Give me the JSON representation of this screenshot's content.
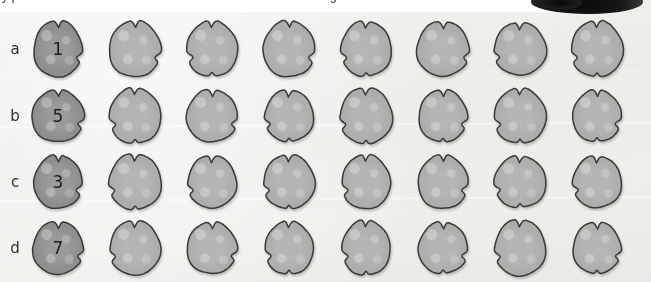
{
  "figure": {
    "title_fragment_left": "y p",
    "title_fragment_right": "g",
    "background_color": "#f1f0ed",
    "corner_object": "dark-blob",
    "grid": {
      "rows": 4,
      "columns": 8,
      "row_labels": [
        "a",
        "b",
        "c",
        "d"
      ],
      "column_x_centers": [
        58,
        135,
        212,
        289,
        366,
        443,
        520,
        597
      ],
      "row_y_centers": [
        49,
        116,
        182,
        248
      ]
    },
    "colors": {
      "specimen_fill_light": "#adadab",
      "specimen_fill_dark": "#8e8e8c",
      "specimen_outline": "#3a3a38",
      "label_text": "#2f2f2f",
      "number_text": "#1e1e1e",
      "strip_background": "#ffffff"
    },
    "rows": [
      {
        "label": "a",
        "cells": [
          {
            "number": "1",
            "shade": "dark"
          },
          {
            "number": "",
            "shade": "light"
          },
          {
            "number": "",
            "shade": "light"
          },
          {
            "number": "",
            "shade": "light"
          },
          {
            "number": "",
            "shade": "light"
          },
          {
            "number": "",
            "shade": "light"
          },
          {
            "number": "",
            "shade": "light"
          },
          {
            "number": "",
            "shade": "light"
          }
        ]
      },
      {
        "label": "b",
        "cells": [
          {
            "number": "5",
            "shade": "dark"
          },
          {
            "number": "",
            "shade": "light"
          },
          {
            "number": "",
            "shade": "light"
          },
          {
            "number": "",
            "shade": "light"
          },
          {
            "number": "",
            "shade": "light"
          },
          {
            "number": "",
            "shade": "light"
          },
          {
            "number": "",
            "shade": "light"
          },
          {
            "number": "",
            "shade": "light"
          }
        ]
      },
      {
        "label": "c",
        "cells": [
          {
            "number": "3",
            "shade": "dark"
          },
          {
            "number": "",
            "shade": "light"
          },
          {
            "number": "",
            "shade": "light"
          },
          {
            "number": "",
            "shade": "light"
          },
          {
            "number": "",
            "shade": "light"
          },
          {
            "number": "",
            "shade": "light"
          },
          {
            "number": "",
            "shade": "light"
          },
          {
            "number": "",
            "shade": "light"
          }
        ]
      },
      {
        "label": "d",
        "cells": [
          {
            "number": "7",
            "shade": "dark"
          },
          {
            "number": "",
            "shade": "light"
          },
          {
            "number": "",
            "shade": "light"
          },
          {
            "number": "",
            "shade": "light"
          },
          {
            "number": "",
            "shade": "light"
          },
          {
            "number": "",
            "shade": "light"
          },
          {
            "number": "",
            "shade": "light"
          },
          {
            "number": "",
            "shade": "light"
          }
        ]
      }
    ]
  }
}
